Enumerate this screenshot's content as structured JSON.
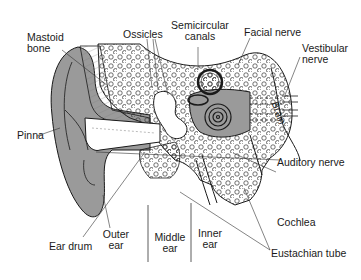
{
  "diagram": {
    "labels": {
      "mastoid_bone_1": "Mastoid",
      "mastoid_bone_2": "bone",
      "ossicles": "Ossicles",
      "semicircular_1": "Semicircular",
      "semicircular_2": "canals",
      "facial_nerve": "Facial nerve",
      "vestibular_1": "Vestibular",
      "vestibular_2": "nerve",
      "brain": "Brain",
      "pinna": "Pinna",
      "auditory_nerve": "Auditory nerve",
      "cochlea": "Cochlea",
      "eustachian_tube": "Eustachian tube",
      "ear_drum": "Ear drum",
      "outer_ear_1": "Outer",
      "outer_ear_2": "ear",
      "middle_ear_1": "Middle",
      "middle_ear_2": "ear",
      "inner_ear_1": "Inner",
      "inner_ear_2": "ear"
    },
    "colors": {
      "tissue_gray": "#9a9a9a",
      "line": "#1a1a1a",
      "background": "#ffffff"
    }
  }
}
